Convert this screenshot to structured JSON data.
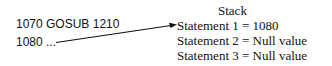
{
  "code": {
    "lines": [
      "1070 GOSUB 1210",
      "1080 ..."
    ]
  },
  "stack": {
    "title": "Stack",
    "entries": [
      {
        "label": "Statement 1",
        "eq": "=",
        "value": "1080"
      },
      {
        "label": "Statement 2",
        "eq": "=",
        "value": "Null value"
      },
      {
        "label": "Statement 3",
        "eq": "=",
        "value": "Null value"
      }
    ]
  },
  "colors": {
    "ink": "#111111",
    "background": "#ffffff"
  }
}
